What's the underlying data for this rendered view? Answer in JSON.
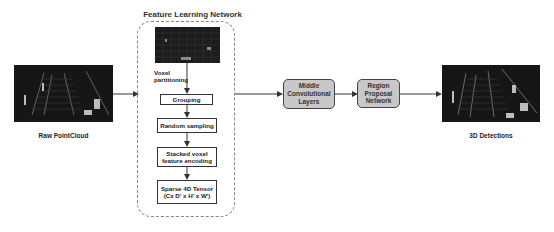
{
  "diagram": {
    "feature_learning": {
      "title": "Feature Learning Network",
      "voxel_label_line1": "Voxel",
      "voxel_label_line2": "partitioning",
      "steps": [
        {
          "label": "Grouping"
        },
        {
          "label": "Random sampling"
        },
        {
          "line1": "Stacked voxel",
          "line2": "feature encoding"
        },
        {
          "line1": "Sparse 4D Tensor",
          "line2": "(Cx D' x H' x W')"
        }
      ]
    },
    "input": {
      "label": "Raw PointCloud"
    },
    "middle": {
      "line1": "Middle",
      "line2": "Convolutional",
      "line3": "Layers"
    },
    "rpn": {
      "line1": "Region",
      "line2": "Proposal",
      "line3": "Network"
    },
    "output": {
      "label": "3D Detections"
    },
    "colors": {
      "arrow": "#333333",
      "dashed_border": "#888888",
      "gray_box": "#c8c8c8",
      "image_bg": "#1a1a1a"
    }
  }
}
